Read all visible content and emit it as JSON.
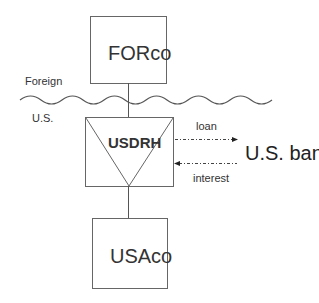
{
  "diagram": {
    "type": "corporate-structure",
    "nodes": {
      "forco": {
        "label": "FORco"
      },
      "usdrh": {
        "label": "USDRH",
        "shape": "box-with-inverted-triangle"
      },
      "usaco": {
        "label": "USAco"
      },
      "us_bank": {
        "label": "U.S. bank"
      }
    },
    "regions": {
      "upper": "Foreign",
      "lower": "U.S."
    },
    "edges": [
      {
        "from": "forco",
        "to": "usdrh",
        "style": "solid"
      },
      {
        "from": "usdrh",
        "to": "usaco",
        "style": "solid"
      },
      {
        "from": "usdrh",
        "to": "us_bank",
        "label": "loan",
        "style": "dash-dot-arrow"
      },
      {
        "from": "us_bank",
        "to": "usdrh",
        "label": "interest",
        "style": "dash-dot-arrow"
      }
    ],
    "colors": {
      "line": "#555555",
      "text": "#222222"
    }
  }
}
